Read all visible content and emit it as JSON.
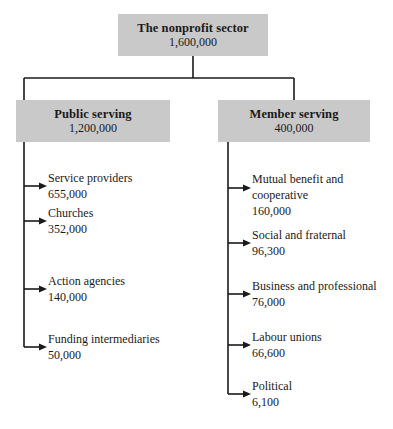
{
  "diagram": {
    "root": {
      "title": "The nonprofit sector",
      "value": "1,600,000"
    },
    "branches": [
      {
        "title": "Public serving",
        "value": "1,200,000",
        "children": [
          {
            "label": "Service providers",
            "label2": "",
            "value": "655,000"
          },
          {
            "label": "Churches",
            "label2": "",
            "value": "352,000"
          },
          {
            "label": "Action agencies",
            "label2": "",
            "value": "140,000"
          },
          {
            "label": "Funding intermediaries",
            "label2": "",
            "value": "50,000"
          }
        ]
      },
      {
        "title": "Member serving",
        "value": "400,000",
        "children": [
          {
            "label": "Mutual benefit and",
            "label2": "cooperative",
            "value": "160,000"
          },
          {
            "label": "Social and fraternal",
            "label2": "",
            "value": "96,300"
          },
          {
            "label": "Business and professional",
            "label2": "",
            "value": "76,000"
          },
          {
            "label": "Labour unions",
            "label2": "",
            "value": "66,600"
          },
          {
            "label": "Political",
            "label2": "",
            "value": "6,100"
          }
        ]
      }
    ],
    "colors": {
      "box_fill": "#c9c9c9",
      "line": "#1a1a1a",
      "text": "#1a1a1a",
      "background": "#ffffff"
    }
  }
}
